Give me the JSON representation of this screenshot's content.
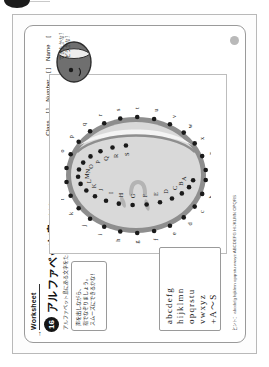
{
  "scan": {
    "corner_marker": "binding-dot"
  },
  "worksheet": {
    "tag_label": "Worksheet",
    "tag_arrow": "→",
    "number": "16",
    "title": "アルファベット島",
    "subtitle": "小文字 a～ z 大文字 A～ S",
    "lead_text": "アルファベット島にある文字をたどってみよう！ゆびでなぞりながらいってみよう！",
    "identity": {
      "class_label": "Class",
      "class_value": "[      ]",
      "number_label": "Number",
      "number_value": "[      ]",
      "name_label": "Name",
      "name_value": "["
    },
    "instruction_box": {
      "lines": [
        "声を出しながら、",
        "指でなぞりましょう。",
        "スムーズにできるかな！"
      ]
    },
    "character": {
      "caption_lines": [
        "できたかな？",
        "どうかな？"
      ]
    },
    "abc_chart": {
      "rows": [
        "abcdefg",
        "hijklmn",
        "opqrstu",
        "vwxyz",
        "+A～S"
      ]
    },
    "hint": "ヒント： abcdefg hijklmn opqrstu vwxyz  ABCDEFG HIJKLMN OPQRS"
  },
  "island": {
    "outer_letters": [
      "a",
      "b",
      "c",
      "d",
      "e",
      "f",
      "g",
      "h",
      "i",
      "j",
      "k",
      "l",
      "m",
      "n",
      "o",
      "p",
      "q",
      "r",
      "s",
      "t",
      "u",
      "v",
      "w",
      "x",
      "y",
      "z"
    ],
    "inner_letters": [
      "A",
      "B",
      "C",
      "D",
      "E",
      "F",
      "G",
      "H",
      "I",
      "J",
      "K",
      "L",
      "M",
      "N",
      "O",
      "P",
      "Q",
      "R",
      "S"
    ],
    "colors": {
      "land": "#d9d9d9",
      "shore": "#8e8e8e",
      "beach": "#f2f2f2",
      "dot": "#1a1a1a",
      "detail": "#b4b4b4"
    }
  }
}
